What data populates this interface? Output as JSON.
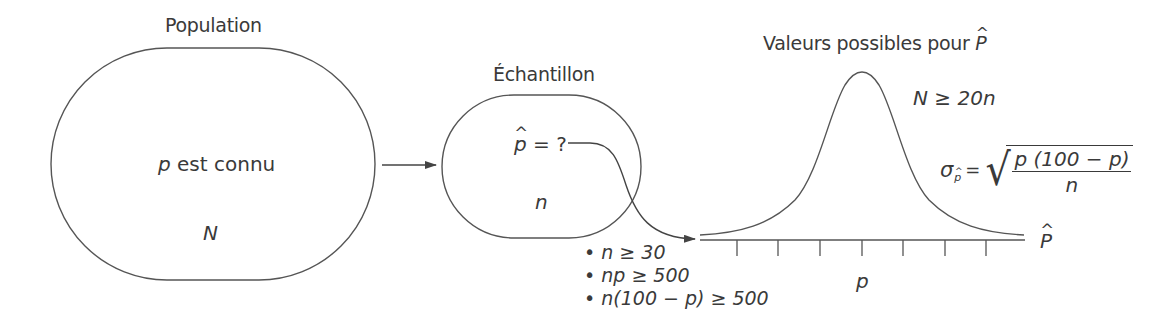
{
  "population": {
    "title": "Population",
    "param_symbol": "p",
    "param_text": " est connu",
    "size_symbol": "N"
  },
  "sample": {
    "title": "Échantillon",
    "estimator_symbol": "p",
    "estimator_text": " = ?",
    "size_symbol": "n"
  },
  "distribution": {
    "title_text": "Valeurs possibles pour ",
    "title_symbol": "P",
    "condition_N": "N ≥ 20n",
    "sigma_symbol": "σ",
    "sigma_subscript": "p",
    "equals": "=",
    "formula_numerator": "p (100 − p)",
    "formula_denominator": "n",
    "axis_label": "P",
    "center_label": "p",
    "tick_count": 7
  },
  "conditions": [
    "• n ≥ 30",
    "• np ≥ 500",
    "• n(100 − p) ≥ 500"
  ],
  "colors": {
    "stroke": "#555555",
    "text": "#3a3a3a",
    "background": "#ffffff"
  }
}
